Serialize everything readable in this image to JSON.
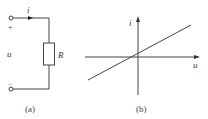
{
  "figure_a": {
    "current_label": "i",
    "voltage_label": "u",
    "plus_sign": "+",
    "minus_sign": "−",
    "resistor_label": "R",
    "caption": "(a)"
  },
  "figure_b": {
    "y_axis_label": "i",
    "x_axis_label": "u",
    "caption": "(b)"
  },
  "colors": {
    "line": "#444444",
    "text": "#333333"
  }
}
